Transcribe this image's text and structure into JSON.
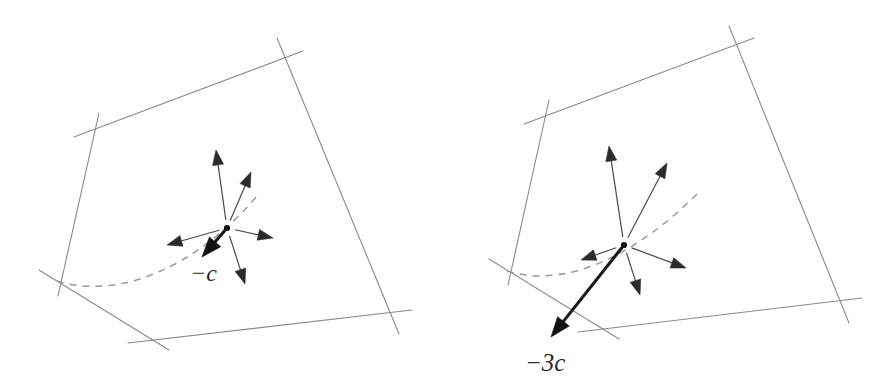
{
  "figure": {
    "background_color": "#ffffff",
    "width": 887,
    "height": 377,
    "panel_count": 2
  },
  "colors": {
    "patch_edge": "#8a8a8a",
    "dashed_curve": "#9a9a9a",
    "thin_vector": "#4a4a4a",
    "bold_vector": "#1a1a1a",
    "arrowhead": "#2b2b2b",
    "label_text": "#2b2b2b",
    "basepoint": "#111111"
  },
  "panels": [
    {
      "id": "left-panel",
      "name": "panel-minus-c",
      "label": "−c",
      "label_position": {
        "x": 190,
        "y": 281
      },
      "basepoint": {
        "x": 227,
        "y": 228
      },
      "patch_corners": [
        {
          "x": 92,
          "y": 130
        },
        {
          "x": 285,
          "y": 58
        },
        {
          "x": 391,
          "y": 315
        },
        {
          "x": 147,
          "y": 340
        },
        {
          "x": 48,
          "y": 282
        }
      ],
      "patch_edges": [
        {
          "name": "top-edge",
          "x1": 74,
          "y1": 137,
          "x2": 303,
          "y2": 51
        },
        {
          "name": "right-edge",
          "x1": 277,
          "y1": 38,
          "x2": 399,
          "y2": 334
        },
        {
          "name": "bottom-edge",
          "x1": 128,
          "y1": 343,
          "x2": 412,
          "y2": 310
        },
        {
          "name": "lower-left-edge",
          "x1": 39,
          "y1": 270,
          "x2": 169,
          "y2": 350
        },
        {
          "name": "left-edge",
          "x1": 99,
          "y1": 113,
          "x2": 58,
          "y2": 296
        }
      ],
      "dashed_curve": {
        "name": "geodesic-curve",
        "start": {
          "x": 57,
          "y": 281
        },
        "control1": {
          "x": 118,
          "y": 300
        },
        "control2": {
          "x": 196,
          "y": 268
        },
        "end": {
          "x": 257,
          "y": 196
        }
      },
      "vectors": [
        {
          "name": "vector-up",
          "tip": {
            "x": 216,
            "y": 150
          },
          "style": "thin"
        },
        {
          "name": "vector-up-right",
          "tip": {
            "x": 251,
            "y": 172
          },
          "style": "thin"
        },
        {
          "name": "vector-right",
          "tip": {
            "x": 273,
            "y": 238
          },
          "style": "thin"
        },
        {
          "name": "vector-down",
          "tip": {
            "x": 245,
            "y": 284
          },
          "style": "thin"
        },
        {
          "name": "vector-left",
          "tip": {
            "x": 167,
            "y": 245
          },
          "style": "thin"
        },
        {
          "name": "vector-minus-c",
          "tip": {
            "x": 202,
            "y": 257
          },
          "style": "bold"
        }
      ]
    },
    {
      "id": "right-panel",
      "name": "panel-minus-3c",
      "label": "−3c",
      "label_position": {
        "x": 525,
        "y": 371
      },
      "basepoint": {
        "x": 624,
        "y": 245
      },
      "patch_corners": [
        {
          "x": 542,
          "y": 117
        },
        {
          "x": 737,
          "y": 46
        },
        {
          "x": 840,
          "y": 305
        },
        {
          "x": 597,
          "y": 330
        },
        {
          "x": 498,
          "y": 271
        }
      ],
      "patch_edges": [
        {
          "name": "top-edge",
          "x1": 524,
          "y1": 124,
          "x2": 754,
          "y2": 38
        },
        {
          "name": "right-edge",
          "x1": 729,
          "y1": 26,
          "x2": 849,
          "y2": 323
        },
        {
          "name": "bottom-edge",
          "x1": 578,
          "y1": 332,
          "x2": 862,
          "y2": 298
        },
        {
          "name": "lower-left-edge",
          "x1": 489,
          "y1": 259,
          "x2": 619,
          "y2": 339
        },
        {
          "name": "left-edge",
          "x1": 549,
          "y1": 100,
          "x2": 508,
          "y2": 285
        }
      ],
      "dashed_curve": {
        "name": "geodesic-curve",
        "start": {
          "x": 507,
          "y": 271
        },
        "control1": {
          "x": 568,
          "y": 290
        },
        "control2": {
          "x": 640,
          "y": 252
        },
        "end": {
          "x": 700,
          "y": 191
        }
      },
      "vectors": [
        {
          "name": "vector-up",
          "tip": {
            "x": 609,
            "y": 146
          },
          "style": "thin"
        },
        {
          "name": "vector-up-right",
          "tip": {
            "x": 667,
            "y": 163
          },
          "style": "thin"
        },
        {
          "name": "vector-right",
          "tip": {
            "x": 686,
            "y": 268
          },
          "style": "thin"
        },
        {
          "name": "vector-down",
          "tip": {
            "x": 640,
            "y": 295
          },
          "style": "thin"
        },
        {
          "name": "vector-left",
          "tip": {
            "x": 581,
            "y": 260
          },
          "style": "thin"
        },
        {
          "name": "vector-minus-3c",
          "tip": {
            "x": 551,
            "y": 337
          },
          "style": "bold"
        }
      ]
    }
  ]
}
